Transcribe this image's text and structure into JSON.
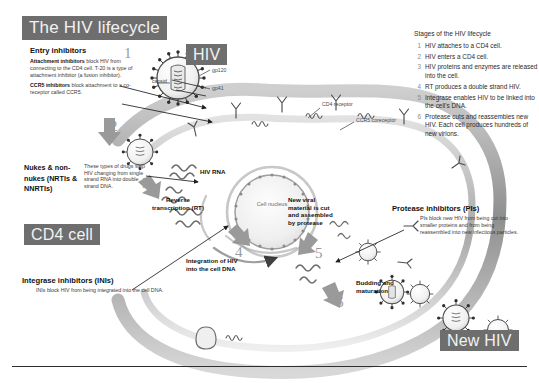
{
  "title": "The HIV lifecycle",
  "badges": {
    "hiv": "HIV",
    "cd4_cell": "CD4 cell",
    "new_hiv": "New HIV"
  },
  "entry_inhibitors": {
    "heading": "Entry inhibitors",
    "attachment_bold": "Attachment inhibitors",
    "attachment_text": " block HIV from connecting to the CD4 cell. T-20 is a type of attachment inhibitor (a fusion inhibitor).",
    "ccr5_bold": "CCR5 inhibitors",
    "ccr5_text": " block attachment to a co-receptor called CCR5."
  },
  "nukes": {
    "heading": "Nukes & non-nukes (NRTIs & NNRTIs)",
    "text": "These types of drugs stop HIV changing from single strand RNA into double strand DNA."
  },
  "integrase": {
    "heading": "Integrase inhibitors (INIs)",
    "text": "INIs block HIV from being integrated into the cell DNA."
  },
  "protease": {
    "heading": "Protease inhibitors (PIs)",
    "text": "PIs block new HIV from being cut into smaller proteins and from being reassembled into new infectious particles."
  },
  "stages": {
    "title": "Stages of the HIV lifecycle",
    "items": [
      {
        "num": "1",
        "text": "HIV attaches to a CD4 cell."
      },
      {
        "num": "2",
        "text": "HIV enters a CD4 cell."
      },
      {
        "num": "3",
        "text": "HIV proteins and enzymes are released into the cell."
      },
      {
        "num": "4",
        "text": "RT produces a double strand HIV."
      },
      {
        "num": "5",
        "text": "Integrase enables HIV to be linked into the cell's DNA."
      },
      {
        "num": "6",
        "text": "Protease cuts and reassembles new HIV. Each cell produces hundreds of new virions."
      }
    ]
  },
  "diagram_labels": {
    "hiv_rna": "HIV RNA",
    "reverse_transcription": "Reverse transcription (RT)",
    "integration": "Integration of HIV into the cell DNA",
    "new_viral_material": "New viral material is cut and assembled by protease",
    "budding": "Budding and maturation",
    "cell_nucleus": "Cell nucleus",
    "capsid": "capsid",
    "gp120": "gp120",
    "gp41": "gp41",
    "cd4_receptor": "CD4 receptor",
    "ccr5_coreceptor": "CCR5 coreceptor"
  },
  "step_numbers": [
    "1",
    "2",
    "3",
    "4",
    "5",
    "6"
  ],
  "colors": {
    "badge_bg": "#6e6e6e",
    "badge_text": "#f2f2f2",
    "body_text": "#3a3a3a",
    "heading_text": "#111111",
    "step_number": "#9a9a9a",
    "membrane": "#9b9b9b"
  },
  "footnote": ""
}
